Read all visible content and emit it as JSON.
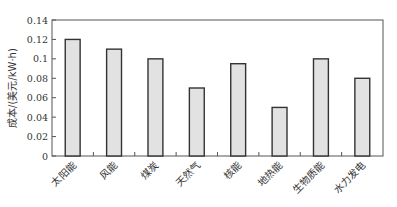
{
  "chart_data": {
    "type": "bar",
    "title": "",
    "xlabel": "",
    "ylabel": "成本/(美元/kW·h)",
    "categories": [
      "太阳能",
      "风能",
      "煤炭",
      "天然气",
      "核能",
      "地热能",
      "生物质能",
      "水力发电"
    ],
    "values": [
      0.12,
      0.11,
      0.1,
      0.07,
      0.095,
      0.05,
      0.1,
      0.08
    ],
    "ylim": [
      0,
      0.14
    ],
    "yticks": [
      0,
      0.02,
      0.04,
      0.06,
      0.08,
      0.1,
      0.12,
      0.14
    ],
    "ytick_labels": [
      "0",
      "0.02",
      "0.04",
      "0.06",
      "0.08",
      "0.1",
      "0.12",
      "0.14"
    ],
    "grid": false,
    "legend": "none",
    "colors": {
      "bar_fill": "#e2e2e2",
      "bar_stroke": "#333333",
      "axis": "#555555"
    }
  }
}
